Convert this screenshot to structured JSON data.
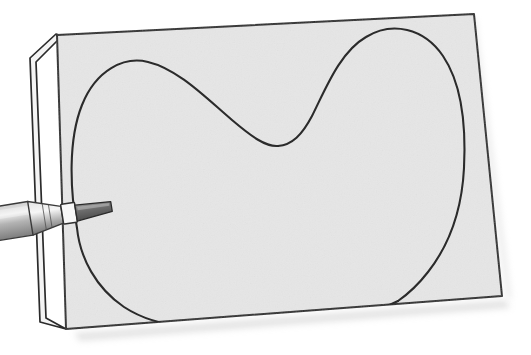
{
  "illustration": {
    "title": "Craft knife cutting a heart shape out of paper",
    "subject": "paper-cutting",
    "style": "line drawing with flat grey fills",
    "background_color": "#ffffff"
  },
  "palette": {
    "background": "#ffffff",
    "paper_front_fill": "#e6e6e6",
    "paper_back_fill": "#f2f2f2",
    "paper_edge_stroke": "#2b2b2b",
    "cut_line_stroke": "#2b2b2b",
    "knife_body_light": "#d8d8d8",
    "knife_body_mid": "#9a9a9a",
    "knife_body_dark": "#6e6e6e",
    "blade_fill": "#6b6b6b",
    "ferrule_fill": "#f4f4f4",
    "shadow_color": "#c9c9c9"
  },
  "objects": {
    "paper_back_sheet": {
      "name": "back sheet of paper",
      "fill": "#f2f2f2",
      "points": "28,57 53,34 58,36 34,63 34,320"
    },
    "paper_front_sheet": {
      "name": "front sheet of paper",
      "fill": "#e6e6e6",
      "corners": {
        "top_left": [
          57,
          35
        ],
        "top_right": [
          474,
          14
        ],
        "bottom_right": [
          502,
          296
        ],
        "bottom_left": [
          66,
          329
        ]
      }
    },
    "heart_cut_line": {
      "name": "heart shaped cut line",
      "stroke": "#2b2b2b",
      "stroke_width": 2.1,
      "key_points": {
        "left_lobe_peak": [
          131,
          63
        ],
        "cleft_bottom": [
          278,
          146
        ],
        "right_lobe_peak": [
          392,
          31
        ],
        "left_edge_at_blade": [
          78,
          226
        ],
        "bottom_point_left": [
          186,
          326
        ],
        "right_edge_low": [
          398,
          298
        ]
      }
    },
    "craft_knife": {
      "name": "craft knife / scalpel",
      "tip_position": [
        80,
        225
      ],
      "angle_degrees": -9,
      "parts": [
        "handle",
        "ferrule",
        "blade"
      ]
    },
    "drop_shadow": {
      "name": "soft shadow under paper",
      "color": "#c9c9c9",
      "opacity": 0.55
    }
  },
  "labels": {
    "alt_text": "A craft knife blade cutting a large heart shape out of a sheet of grey paper resting on a second sheet."
  }
}
